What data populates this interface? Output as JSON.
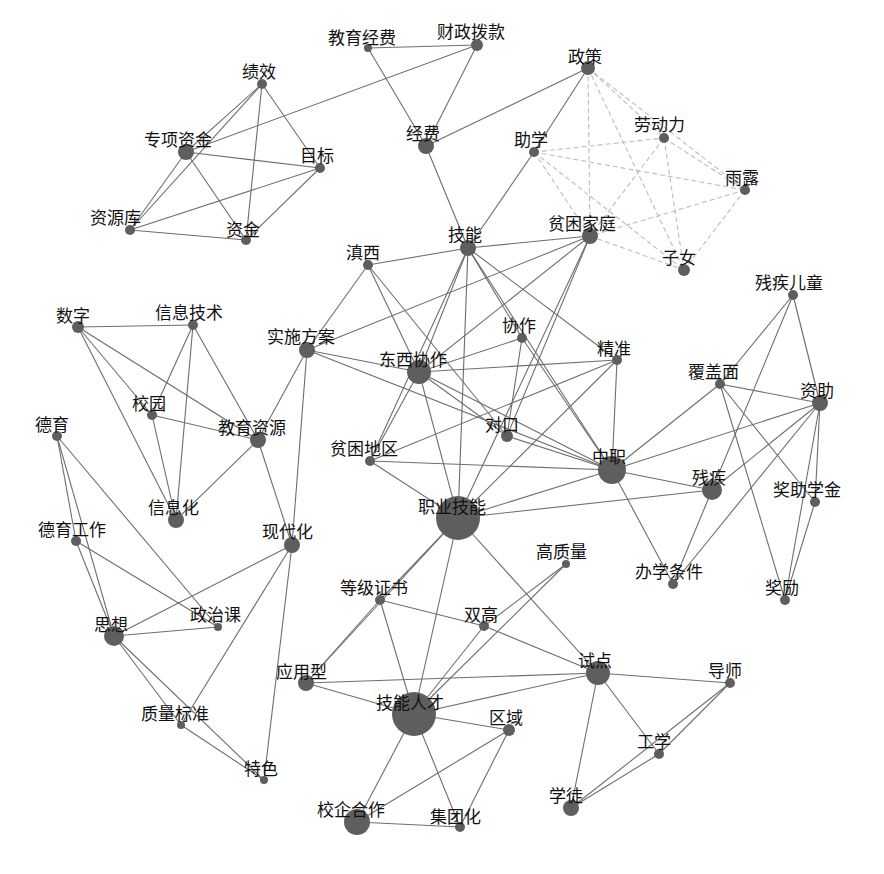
{
  "chart_data": {
    "type": "network",
    "title": "",
    "colors": {
      "node": "#5e5e5e",
      "edge": "#6e6e6e",
      "edge_light": "#bdbdbd",
      "label": "#111111",
      "background": "#ffffff"
    },
    "nodes": [
      {
        "id": "教育经费",
        "x": 368,
        "y": 48,
        "r": 4,
        "lx": -40,
        "ly": -24
      },
      {
        "id": "财政拨款",
        "x": 477,
        "y": 45,
        "r": 6,
        "lx": -40,
        "ly": -27
      },
      {
        "id": "政策",
        "x": 588,
        "y": 68,
        "r": 7,
        "lx": -20,
        "ly": -25
      },
      {
        "id": "绩效",
        "x": 262,
        "y": 84,
        "r": 5,
        "lx": -20,
        "ly": -26
      },
      {
        "id": "专项资金",
        "x": 186,
        "y": 152,
        "r": 8,
        "lx": -42,
        "ly": -26
      },
      {
        "id": "目标",
        "x": 320,
        "y": 168,
        "r": 5,
        "lx": -20,
        "ly": -26
      },
      {
        "id": "资源库",
        "x": 130,
        "y": 230,
        "r": 5,
        "lx": -40,
        "ly": -26
      },
      {
        "id": "资金",
        "x": 246,
        "y": 240,
        "r": 5,
        "lx": -20,
        "ly": -24
      },
      {
        "id": "经费",
        "x": 426,
        "y": 146,
        "r": 8,
        "lx": -20,
        "ly": -26
      },
      {
        "id": "助学",
        "x": 534,
        "y": 152,
        "r": 5,
        "lx": -20,
        "ly": -26
      },
      {
        "id": "劳动力",
        "x": 664,
        "y": 138,
        "r": 5,
        "lx": -30,
        "ly": -27
      },
      {
        "id": "雨露",
        "x": 745,
        "y": 190,
        "r": 5,
        "lx": -20,
        "ly": -26
      },
      {
        "id": "技能",
        "x": 468,
        "y": 248,
        "r": 8,
        "lx": -20,
        "ly": -27
      },
      {
        "id": "贫困家庭",
        "x": 590,
        "y": 236,
        "r": 8,
        "lx": -42,
        "ly": -26
      },
      {
        "id": "子女",
        "x": 684,
        "y": 270,
        "r": 6,
        "lx": -22,
        "ly": -26
      },
      {
        "id": "滇西",
        "x": 368,
        "y": 265,
        "r": 5,
        "lx": -22,
        "ly": -26
      },
      {
        "id": "残疾儿童",
        "x": 793,
        "y": 295,
        "r": 5,
        "lx": -38,
        "ly": -26
      },
      {
        "id": "数字",
        "x": 78,
        "y": 327,
        "r": 6,
        "lx": -22,
        "ly": -25
      },
      {
        "id": "信息技术",
        "x": 193,
        "y": 325,
        "r": 5,
        "lx": -38,
        "ly": -26
      },
      {
        "id": "实施方案",
        "x": 307,
        "y": 350,
        "r": 8,
        "lx": -40,
        "ly": -27
      },
      {
        "id": "东西协作",
        "x": 419,
        "y": 372,
        "r": 12,
        "lx": -40,
        "ly": -26
      },
      {
        "id": "协作",
        "x": 522,
        "y": 338,
        "r": 5,
        "lx": -20,
        "ly": -26
      },
      {
        "id": "精准",
        "x": 617,
        "y": 360,
        "r": 5,
        "lx": -20,
        "ly": -25
      },
      {
        "id": "覆盖面",
        "x": 720,
        "y": 384,
        "r": 5,
        "lx": -32,
        "ly": -26
      },
      {
        "id": "资助",
        "x": 820,
        "y": 403,
        "r": 8,
        "lx": -20,
        "ly": -26
      },
      {
        "id": "校园",
        "x": 152,
        "y": 415,
        "r": 5,
        "lx": -20,
        "ly": -25
      },
      {
        "id": "教育资源",
        "x": 258,
        "y": 440,
        "r": 8,
        "lx": -40,
        "ly": -26
      },
      {
        "id": "德育",
        "x": 57,
        "y": 436,
        "r": 5,
        "lx": -22,
        "ly": -25
      },
      {
        "id": "对口",
        "x": 507,
        "y": 436,
        "r": 6,
        "lx": -22,
        "ly": -25
      },
      {
        "id": "贫困地区",
        "x": 370,
        "y": 461,
        "r": 5,
        "lx": -40,
        "ly": -26
      },
      {
        "id": "中职",
        "x": 612,
        "y": 470,
        "r": 14,
        "lx": -20,
        "ly": -27
      },
      {
        "id": "信息化",
        "x": 176,
        "y": 520,
        "r": 8,
        "lx": -28,
        "ly": -26
      },
      {
        "id": "残疾",
        "x": 712,
        "y": 490,
        "r": 10,
        "lx": -20,
        "ly": -26
      },
      {
        "id": "职业技能",
        "x": 458,
        "y": 518,
        "r": 22,
        "lx": -40,
        "ly": -25
      },
      {
        "id": "德育工作",
        "x": 76,
        "y": 541,
        "r": 5,
        "lx": -38,
        "ly": -25
      },
      {
        "id": "现代化",
        "x": 292,
        "y": 545,
        "r": 8,
        "lx": -30,
        "ly": -27
      },
      {
        "id": "奖助学金",
        "x": 815,
        "y": 502,
        "r": 5,
        "lx": -42,
        "ly": -26
      },
      {
        "id": "高质量",
        "x": 566,
        "y": 564,
        "r": 4,
        "lx": -30,
        "ly": -26
      },
      {
        "id": "办学条件",
        "x": 673,
        "y": 584,
        "r": 5,
        "lx": -38,
        "ly": -26
      },
      {
        "id": "奖励",
        "x": 785,
        "y": 600,
        "r": 5,
        "lx": -20,
        "ly": -26
      },
      {
        "id": "等级证书",
        "x": 380,
        "y": 600,
        "r": 5,
        "lx": -40,
        "ly": -26
      },
      {
        "id": "双高",
        "x": 484,
        "y": 626,
        "r": 5,
        "lx": -20,
        "ly": -25
      },
      {
        "id": "政治课",
        "x": 218,
        "y": 627,
        "r": 4,
        "lx": -28,
        "ly": -26
      },
      {
        "id": "思想",
        "x": 114,
        "y": 636,
        "r": 10,
        "lx": -20,
        "ly": -25
      },
      {
        "id": "试点",
        "x": 598,
        "y": 673,
        "r": 12,
        "lx": -20,
        "ly": -26
      },
      {
        "id": "应用型",
        "x": 306,
        "y": 683,
        "r": 8,
        "lx": -30,
        "ly": -25
      },
      {
        "id": "导师",
        "x": 730,
        "y": 683,
        "r": 5,
        "lx": -22,
        "ly": -26
      },
      {
        "id": "技能人才",
        "x": 414,
        "y": 714,
        "r": 22,
        "lx": -38,
        "ly": -25
      },
      {
        "id": "区域",
        "x": 509,
        "y": 730,
        "r": 6,
        "lx": -20,
        "ly": -26
      },
      {
        "id": "质量标准",
        "x": 181,
        "y": 725,
        "r": 4,
        "lx": -40,
        "ly": -25
      },
      {
        "id": "工学",
        "x": 659,
        "y": 754,
        "r": 5,
        "lx": -22,
        "ly": -26
      },
      {
        "id": "特色",
        "x": 264,
        "y": 780,
        "r": 4,
        "lx": -20,
        "ly": -25
      },
      {
        "id": "学徒",
        "x": 571,
        "y": 808,
        "r": 8,
        "lx": -22,
        "ly": -26
      },
      {
        "id": "校企合作",
        "x": 357,
        "y": 822,
        "r": 13,
        "lx": -40,
        "ly": -26
      },
      {
        "id": "集团化",
        "x": 460,
        "y": 827,
        "r": 5,
        "lx": -30,
        "ly": -24
      }
    ],
    "edges": [
      [
        "教育经费",
        "财政拨款"
      ],
      [
        "教育经费",
        "经费"
      ],
      [
        "财政拨款",
        "经费"
      ],
      [
        "财政拨款",
        "专项资金"
      ],
      [
        "政策",
        "经费"
      ],
      [
        "政策",
        "助学"
      ],
      [
        "经费",
        "技能"
      ],
      [
        "绩效",
        "专项资金"
      ],
      [
        "绩效",
        "资源库"
      ],
      [
        "绩效",
        "资金"
      ],
      [
        "绩效",
        "目标"
      ],
      [
        "专项资金",
        "目标"
      ],
      [
        "专项资金",
        "资源库"
      ],
      [
        "专项资金",
        "资金"
      ],
      [
        "目标",
        "资源库"
      ],
      [
        "目标",
        "资金"
      ],
      [
        "资源库",
        "资金"
      ],
      [
        "助学",
        "技能"
      ],
      [
        "技能",
        "滇西"
      ],
      [
        "技能",
        "贫困家庭"
      ],
      [
        "技能",
        "东西协作"
      ],
      [
        "技能",
        "贫困地区"
      ],
      [
        "技能",
        "协作"
      ],
      [
        "技能",
        "精准"
      ],
      [
        "技能",
        "职业技能"
      ],
      [
        "技能",
        "中职"
      ],
      [
        "贫困家庭",
        "实施方案"
      ],
      [
        "贫困家庭",
        "东西协作"
      ],
      [
        "贫困家庭",
        "对口"
      ],
      [
        "贫困家庭",
        "职业技能"
      ],
      [
        "滇西",
        "实施方案"
      ],
      [
        "滇西",
        "东西协作"
      ],
      [
        "滇西",
        "对口"
      ],
      [
        "实施方案",
        "东西协作"
      ],
      [
        "实施方案",
        "教育资源"
      ],
      [
        "实施方案",
        "现代化"
      ],
      [
        "实施方案",
        "中职"
      ],
      [
        "东西协作",
        "协作"
      ],
      [
        "东西协作",
        "精准"
      ],
      [
        "东西协作",
        "对口"
      ],
      [
        "东西协作",
        "中职"
      ],
      [
        "东西协作",
        "贫困地区"
      ],
      [
        "东西协作",
        "职业技能"
      ],
      [
        "协作",
        "对口"
      ],
      [
        "协作",
        "中职"
      ],
      [
        "精准",
        "中职"
      ],
      [
        "精准",
        "贫困地区"
      ],
      [
        "精准",
        "职业技能"
      ],
      [
        "对口",
        "中职"
      ],
      [
        "贫困地区",
        "中职"
      ],
      [
        "贫困地区",
        "职业技能"
      ],
      [
        "中职",
        "职业技能"
      ],
      [
        "中职",
        "覆盖面"
      ],
      [
        "中职",
        "资助"
      ],
      [
        "中职",
        "残疾"
      ],
      [
        "中职",
        "办学条件"
      ],
      [
        "残疾儿童",
        "覆盖面"
      ],
      [
        "残疾儿童",
        "残疾"
      ],
      [
        "残疾儿童",
        "资助"
      ],
      [
        "覆盖面",
        "资助"
      ],
      [
        "覆盖面",
        "奖助学金"
      ],
      [
        "覆盖面",
        "奖励"
      ],
      [
        "资助",
        "残疾"
      ],
      [
        "资助",
        "办学条件"
      ],
      [
        "资助",
        "奖助学金"
      ],
      [
        "资助",
        "奖励"
      ],
      [
        "残疾",
        "职业技能"
      ],
      [
        "残疾",
        "办学条件"
      ],
      [
        "奖助学金",
        "奖励"
      ],
      [
        "数字",
        "信息技术"
      ],
      [
        "数字",
        "校园"
      ],
      [
        "数字",
        "教育资源"
      ],
      [
        "数字",
        "信息化"
      ],
      [
        "信息技术",
        "校园"
      ],
      [
        "信息技术",
        "信息化"
      ],
      [
        "信息技术",
        "教育资源"
      ],
      [
        "校园",
        "教育资源"
      ],
      [
        "校园",
        "信息化"
      ],
      [
        "教育资源",
        "信息化"
      ],
      [
        "教育资源",
        "现代化"
      ],
      [
        "德育",
        "德育工作"
      ],
      [
        "德育",
        "思想"
      ],
      [
        "德育",
        "政治课"
      ],
      [
        "德育工作",
        "思想"
      ],
      [
        "德育工作",
        "政治课"
      ],
      [
        "现代化",
        "思想"
      ],
      [
        "现代化",
        "质量标准"
      ],
      [
        "现代化",
        "特色"
      ],
      [
        "思想",
        "政治课"
      ],
      [
        "思想",
        "质量标准"
      ],
      [
        "思想",
        "特色"
      ],
      [
        "质量标准",
        "特色"
      ],
      [
        "职业技能",
        "等级证书"
      ],
      [
        "职业技能",
        "应用型"
      ],
      [
        "职业技能",
        "技能人才"
      ],
      [
        "职业技能",
        "试点"
      ],
      [
        "等级证书",
        "应用型"
      ],
      [
        "等级证书",
        "技能人才"
      ],
      [
        "等级证书",
        "双高"
      ],
      [
        "高质量",
        "双高"
      ],
      [
        "高质量",
        "技能人才"
      ],
      [
        "双高",
        "试点"
      ],
      [
        "双高",
        "技能人才"
      ],
      [
        "应用型",
        "技能人才"
      ],
      [
        "应用型",
        "试点"
      ],
      [
        "技能人才",
        "试点"
      ],
      [
        "技能人才",
        "区域"
      ],
      [
        "技能人才",
        "校企合作"
      ],
      [
        "技能人才",
        "集团化"
      ],
      [
        "区域",
        "校企合作"
      ],
      [
        "区域",
        "集团化"
      ],
      [
        "校企合作",
        "集团化"
      ],
      [
        "试点",
        "导师"
      ],
      [
        "试点",
        "工学"
      ],
      [
        "试点",
        "学徒"
      ],
      [
        "导师",
        "工学"
      ],
      [
        "导师",
        "学徒"
      ],
      [
        "工学",
        "学徒"
      ]
    ],
    "light_edges": [
      [
        "政策",
        "劳动力"
      ],
      [
        "政策",
        "雨露"
      ],
      [
        "政策",
        "贫困家庭"
      ],
      [
        "政策",
        "子女"
      ],
      [
        "助学",
        "劳动力"
      ],
      [
        "助学",
        "雨露"
      ],
      [
        "助学",
        "贫困家庭"
      ],
      [
        "助学",
        "子女"
      ],
      [
        "劳动力",
        "雨露"
      ],
      [
        "劳动力",
        "贫困家庭"
      ],
      [
        "劳动力",
        "子女"
      ],
      [
        "雨露",
        "贫困家庭"
      ],
      [
        "雨露",
        "子女"
      ],
      [
        "贫困家庭",
        "子女"
      ]
    ]
  }
}
